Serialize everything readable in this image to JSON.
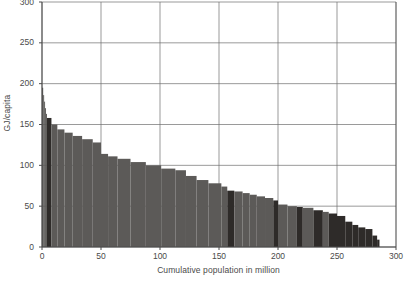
{
  "chart_data": {
    "type": "bar",
    "title": "",
    "subtitle": "",
    "xlabel": "Cumulative population in million",
    "ylabel": "GJ/capita",
    "xlim": [
      0,
      300
    ],
    "ylim": [
      0,
      300
    ],
    "x_ticks": [
      0,
      50,
      100,
      150,
      200,
      250,
      300
    ],
    "y_ticks": [
      0,
      50,
      100,
      150,
      200,
      250,
      300
    ],
    "grid": true,
    "legend": "none",
    "orientation": "vertical",
    "note": "Stepped width-weighted bars: each segment spans a cumulative population range (x_start to x_end, million) at a given GJ/capita value. Darker segments are highlighted.",
    "colors": {
      "bar_normal": "#5c5a58",
      "bar_highlight": "#2e2b29",
      "grid": "#6f6f6f",
      "axis": "#4a4a4a",
      "text": "#4a4a4a",
      "background": "#ffffff"
    },
    "segments": [
      {
        "x_start": 0.0,
        "x_end": 1.0,
        "value": 195,
        "highlight": false
      },
      {
        "x_start": 1.0,
        "x_end": 1.8,
        "value": 186,
        "highlight": false
      },
      {
        "x_start": 1.8,
        "x_end": 2.6,
        "value": 178,
        "highlight": false
      },
      {
        "x_start": 2.6,
        "x_end": 3.4,
        "value": 170,
        "highlight": false
      },
      {
        "x_start": 3.4,
        "x_end": 4.2,
        "value": 163,
        "highlight": false
      },
      {
        "x_start": 4.2,
        "x_end": 8.0,
        "value": 158,
        "highlight": true
      },
      {
        "x_start": 8.0,
        "x_end": 13.0,
        "value": 150,
        "highlight": false
      },
      {
        "x_start": 13.0,
        "x_end": 19.0,
        "value": 144,
        "highlight": false
      },
      {
        "x_start": 19.0,
        "x_end": 26.0,
        "value": 140,
        "highlight": false
      },
      {
        "x_start": 26.0,
        "x_end": 34.0,
        "value": 136,
        "highlight": false
      },
      {
        "x_start": 34.0,
        "x_end": 43.0,
        "value": 132,
        "highlight": false
      },
      {
        "x_start": 43.0,
        "x_end": 50.0,
        "value": 128,
        "highlight": false
      },
      {
        "x_start": 50.0,
        "x_end": 56.0,
        "value": 114,
        "highlight": false
      },
      {
        "x_start": 56.0,
        "x_end": 64.0,
        "value": 111,
        "highlight": false
      },
      {
        "x_start": 64.0,
        "x_end": 75.0,
        "value": 108,
        "highlight": false
      },
      {
        "x_start": 75.0,
        "x_end": 88.0,
        "value": 104,
        "highlight": false
      },
      {
        "x_start": 88.0,
        "x_end": 101.0,
        "value": 100,
        "highlight": false
      },
      {
        "x_start": 101.0,
        "x_end": 113.0,
        "value": 96,
        "highlight": false
      },
      {
        "x_start": 113.0,
        "x_end": 122.0,
        "value": 94,
        "highlight": false
      },
      {
        "x_start": 122.0,
        "x_end": 131.0,
        "value": 87,
        "highlight": false
      },
      {
        "x_start": 131.0,
        "x_end": 141.0,
        "value": 82,
        "highlight": false
      },
      {
        "x_start": 141.0,
        "x_end": 152.0,
        "value": 78,
        "highlight": false
      },
      {
        "x_start": 152.0,
        "x_end": 157.0,
        "value": 74,
        "highlight": false
      },
      {
        "x_start": 157.0,
        "x_end": 163.0,
        "value": 69,
        "highlight": true
      },
      {
        "x_start": 163.0,
        "x_end": 170.0,
        "value": 68,
        "highlight": false
      },
      {
        "x_start": 170.0,
        "x_end": 176.0,
        "value": 66,
        "highlight": false
      },
      {
        "x_start": 176.0,
        "x_end": 182.0,
        "value": 64,
        "highlight": false
      },
      {
        "x_start": 182.0,
        "x_end": 189.0,
        "value": 62,
        "highlight": false
      },
      {
        "x_start": 189.0,
        "x_end": 196.0,
        "value": 60,
        "highlight": false
      },
      {
        "x_start": 196.0,
        "x_end": 200.0,
        "value": 57,
        "highlight": true
      },
      {
        "x_start": 200.0,
        "x_end": 208.0,
        "value": 52,
        "highlight": false
      },
      {
        "x_start": 208.0,
        "x_end": 216.0,
        "value": 50,
        "highlight": false
      },
      {
        "x_start": 216.0,
        "x_end": 221.0,
        "value": 49,
        "highlight": true
      },
      {
        "x_start": 221.0,
        "x_end": 230.0,
        "value": 48,
        "highlight": false
      },
      {
        "x_start": 230.0,
        "x_end": 238.0,
        "value": 45,
        "highlight": true
      },
      {
        "x_start": 238.0,
        "x_end": 243.0,
        "value": 43,
        "highlight": false
      },
      {
        "x_start": 243.0,
        "x_end": 250.0,
        "value": 41,
        "highlight": true
      },
      {
        "x_start": 250.0,
        "x_end": 257.0,
        "value": 38,
        "highlight": true
      },
      {
        "x_start": 257.0,
        "x_end": 263.0,
        "value": 31,
        "highlight": true
      },
      {
        "x_start": 263.0,
        "x_end": 268.0,
        "value": 27,
        "highlight": true
      },
      {
        "x_start": 268.0,
        "x_end": 274.0,
        "value": 24,
        "highlight": true
      },
      {
        "x_start": 274.0,
        "x_end": 280.0,
        "value": 22,
        "highlight": true
      },
      {
        "x_start": 280.0,
        "x_end": 284.0,
        "value": 14,
        "highlight": true
      },
      {
        "x_start": 284.0,
        "x_end": 286.0,
        "value": 9,
        "highlight": true
      }
    ]
  }
}
